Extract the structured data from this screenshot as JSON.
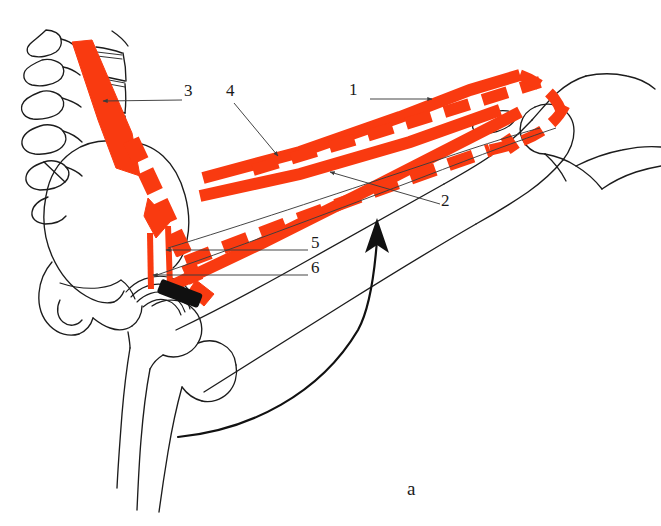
{
  "figure": {
    "panel_label": "a",
    "colors": {
      "muscle_red": "#f93a10",
      "outline_black": "#1c1c1c",
      "leader_gray": "#3c3c3c",
      "joint_axis_black": "#101010",
      "background": "#ffffff"
    }
  },
  "labels": [
    {
      "id": "1",
      "text": "1",
      "x": 354,
      "y": 90,
      "leader": {
        "type": "line",
        "x1": 370,
        "y1": 99,
        "x2": 432,
        "y2": 99,
        "arrow": true
      }
    },
    {
      "id": "2",
      "text": "2",
      "x": 444,
      "y": 200,
      "leader": {
        "type": "line",
        "x1": 440,
        "y1": 204,
        "x2": 330,
        "y2": 172,
        "arrow": true
      }
    },
    {
      "id": "3",
      "text": "3",
      "x": 186,
      "y": 90,
      "leader": {
        "type": "line",
        "x1": 182,
        "y1": 100,
        "x2": 103,
        "y2": 101,
        "arrow": true
      }
    },
    {
      "id": "4",
      "text": "4",
      "x": 228,
      "y": 90,
      "leader": {
        "type": "line",
        "x1": 234,
        "y1": 103,
        "x2": 278,
        "y2": 156,
        "arrow": true
      }
    },
    {
      "id": "5",
      "text": "5",
      "x": 313,
      "y": 243,
      "leader": {
        "type": "line",
        "x1": 308,
        "y1": 250,
        "x2": 166,
        "y2": 250,
        "arrow": true
      }
    },
    {
      "id": "6",
      "text": "6",
      "x": 313,
      "y": 268,
      "leader": {
        "type": "line",
        "x1": 308,
        "y1": 275,
        "x2": 153,
        "y2": 275,
        "arrow": true
      }
    }
  ],
  "anatomy": {
    "structures": [
      "lumbar vertebrae",
      "intervertebral discs",
      "ilium / pelvis",
      "ischium",
      "pubis",
      "acetabulum / hip joint",
      "femoral head",
      "greater trochanter",
      "femoral shaft",
      "distal femur condyles",
      "patella",
      "proximal tibia",
      "fibula head"
    ],
    "muscle_bands": [
      "psoas major (solid, lumbar spine to lesser trochanter)",
      "iliacus (dashed, iliac fossa to lesser trochanter)",
      "rectus femoris (solid, anterior inferior iliac spine to patella)",
      "sartorius (dashed band)",
      "tensor fasciae latae (solid band)",
      "pectineus / adductor strips (two short vertical strips)"
    ]
  },
  "motion_arrow": {
    "name": "hip-flexion-arrow",
    "direction": "upward-curving",
    "tip": {
      "x": 377,
      "y": 222
    },
    "tail": {
      "x": 178,
      "y": 437
    }
  }
}
